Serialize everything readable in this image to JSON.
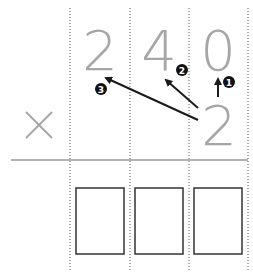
{
  "problem": {
    "multiplicand_digits": [
      "2",
      "4",
      "0"
    ],
    "multiplier": "2",
    "operator": "×",
    "step_labels": [
      "1",
      "2",
      "3"
    ],
    "answer_boxes": [
      "",
      "",
      ""
    ]
  },
  "colors": {
    "digit": "#a6a6a6",
    "arrow": "#1a1a1a",
    "rule": "#999999",
    "box": "#333333"
  }
}
